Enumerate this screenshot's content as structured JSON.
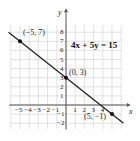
{
  "chart_data": {
    "type": "line",
    "title": "",
    "equation": "4x + 5y = 15",
    "xlabel": "x",
    "ylabel": "y",
    "xlim": [
      -6,
      6
    ],
    "ylim": [
      -3,
      9
    ],
    "grid": true,
    "x_ticks": [
      "−5",
      "−4",
      "−3",
      "−2",
      "−1",
      "1",
      "2",
      "3",
      "4"
    ],
    "y_ticks": [
      "8",
      "7",
      "6",
      "5",
      "4",
      "3",
      "2",
      "1",
      "−1",
      "−2"
    ],
    "series": [
      {
        "name": "4x + 5y = 15",
        "x": [
          -6.25,
          6.25
        ],
        "y": [
          8,
          -2
        ]
      }
    ],
    "points": [
      {
        "label": "(−5, 7)",
        "x": -5,
        "y": 7
      },
      {
        "label": "(0, 3)",
        "x": 0,
        "y": 3
      },
      {
        "label": "(5, −1)",
        "x": 5,
        "y": -1
      }
    ],
    "line_color": "#222222",
    "grid_color": "#cfcfcf"
  },
  "labels": {
    "x_axis": "x",
    "y_axis": "y",
    "equation": "4x + 5y = 15",
    "p1": "(−5, 7)",
    "p2": "(0, 3)",
    "p3": "(5, −1)"
  }
}
